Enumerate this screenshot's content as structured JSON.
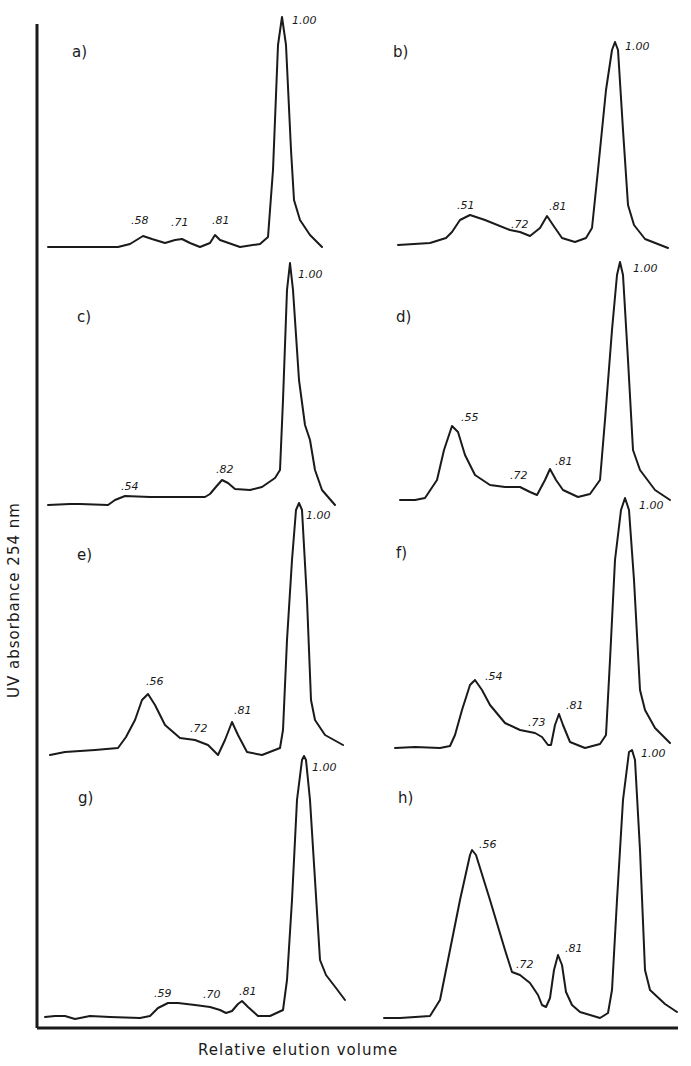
{
  "figure": {
    "ylabel": "UV absorbance   254 nm",
    "xlabel": "Relative elution volume",
    "colors": {
      "ink": "#1a1a1a",
      "background": "#ffffff"
    }
  },
  "chart_data": [
    {
      "type": "line",
      "panel": "a)",
      "xlabel": "Relative elution volume",
      "ylabel": "UV absorbance 254 nm",
      "peaks": [
        {
          "label": ".58",
          "relative_elution": 0.58,
          "relative_height": 0.1
        },
        {
          "label": ".71",
          "relative_elution": 0.71,
          "relative_height": 0.07
        },
        {
          "label": ".81",
          "relative_elution": 0.81,
          "relative_height": 0.09
        },
        {
          "label": "1.00",
          "relative_elution": 1.0,
          "relative_height": 1.0
        }
      ],
      "grid": false
    },
    {
      "type": "line",
      "panel": "b)",
      "xlabel": "Relative elution volume",
      "ylabel": "UV absorbance 254 nm",
      "peaks": [
        {
          "label": ".51",
          "relative_elution": 0.51,
          "relative_height": 0.15
        },
        {
          "label": ".72",
          "relative_elution": 0.72,
          "relative_height": 0.05
        },
        {
          "label": ".81",
          "relative_elution": 0.81,
          "relative_height": 0.14
        },
        {
          "label": "1.00",
          "relative_elution": 1.0,
          "relative_height": 1.0
        }
      ],
      "grid": false
    },
    {
      "type": "line",
      "panel": "c)",
      "xlabel": "Relative elution volume",
      "ylabel": "UV absorbance 254 nm",
      "peaks": [
        {
          "label": ".54",
          "relative_elution": 0.54,
          "relative_height": 0.04
        },
        {
          "label": ".82",
          "relative_elution": 0.82,
          "relative_height": 0.09
        },
        {
          "label": "1.00",
          "relative_elution": 1.0,
          "relative_height": 1.0
        }
      ],
      "grid": false
    },
    {
      "type": "line",
      "panel": "d)",
      "xlabel": "Relative elution volume",
      "ylabel": "UV absorbance 254 nm",
      "peaks": [
        {
          "label": ".55",
          "relative_elution": 0.55,
          "relative_height": 0.34
        },
        {
          "label": ".72",
          "relative_elution": 0.72,
          "relative_height": 0.05
        },
        {
          "label": ".81",
          "relative_elution": 0.81,
          "relative_height": 0.14
        },
        {
          "label": "1.00",
          "relative_elution": 1.0,
          "relative_height": 1.0
        }
      ],
      "grid": false
    },
    {
      "type": "line",
      "panel": "e)",
      "xlabel": "Relative elution volume",
      "ylabel": "UV absorbance 254 nm",
      "peaks": [
        {
          "label": ".56",
          "relative_elution": 0.56,
          "relative_height": 0.37
        },
        {
          "label": ".72",
          "relative_elution": 0.72,
          "relative_height": 0.1
        },
        {
          "label": ".81",
          "relative_elution": 0.81,
          "relative_height": 0.18
        },
        {
          "label": "1.00",
          "relative_elution": 1.0,
          "relative_height": 1.0
        }
      ],
      "grid": false
    },
    {
      "type": "line",
      "panel": "f)",
      "xlabel": "Relative elution volume",
      "ylabel": "UV absorbance 254 nm",
      "peaks": [
        {
          "label": ".54",
          "relative_elution": 0.54,
          "relative_height": 0.33
        },
        {
          "label": ".73",
          "relative_elution": 0.73,
          "relative_height": 0.06
        },
        {
          "label": ".81",
          "relative_elution": 0.81,
          "relative_height": 0.17
        },
        {
          "label": "1.00",
          "relative_elution": 1.0,
          "relative_height": 1.0
        }
      ],
      "grid": false
    },
    {
      "type": "line",
      "panel": "g)",
      "xlabel": "Relative elution volume",
      "ylabel": "UV absorbance 254 nm",
      "peaks": [
        {
          "label": ".59",
          "relative_elution": 0.59,
          "relative_height": 0.06
        },
        {
          "label": ".70",
          "relative_elution": 0.7,
          "relative_height": 0.04
        },
        {
          "label": ".81",
          "relative_elution": 0.81,
          "relative_height": 0.07
        },
        {
          "label": "1.00",
          "relative_elution": 1.0,
          "relative_height": 1.0
        }
      ],
      "grid": false
    },
    {
      "type": "line",
      "panel": "h)",
      "xlabel": "Relative elution volume",
      "ylabel": "UV absorbance 254 nm",
      "peaks": [
        {
          "label": ".56",
          "relative_elution": 0.56,
          "relative_height": 0.65
        },
        {
          "label": ".72",
          "relative_elution": 0.72,
          "relative_height": 0.17
        },
        {
          "label": ".81",
          "relative_elution": 0.81,
          "relative_height": 0.36
        },
        {
          "label": "1.00",
          "relative_elution": 1.0,
          "relative_height": 1.0
        }
      ],
      "grid": false
    }
  ],
  "panels": [
    {
      "id": "a",
      "title": "a)",
      "title_pos": [
        72,
        57
      ],
      "points": "48,247 70,247 118,247 130,244 143,236 152,239 165,243 175,240 182,239 190,243 200,247 210,243 215,235 220,240 240,247 260,244 268,237 273,170 278,45 282,17 286,45 291,150 294,200 300,220 310,235 322,247",
      "labels": [
        {
          "text": ".58",
          "x": 131,
          "y": 224
        },
        {
          "text": ".71",
          "x": 171,
          "y": 226
        },
        {
          "text": ".81",
          "x": 212,
          "y": 224
        },
        {
          "text": "1.00",
          "x": 292,
          "y": 24
        }
      ]
    },
    {
      "id": "b",
      "title": "b)",
      "title_pos": [
        393,
        57
      ],
      "points": "398,245 430,243 446,238 452,232 460,220 470,215 485,220 510,230 520,232 530,236 540,228 547,216 553,225 562,238 575,242 586,238 592,228 598,170 606,90 612,50 615,42 618,50 623,130 628,205 634,225 645,239 668,248",
      "labels": [
        {
          "text": ".51",
          "x": 457,
          "y": 209
        },
        {
          "text": ".72",
          "x": 511,
          "y": 228
        },
        {
          "text": ".81",
          "x": 549,
          "y": 210
        },
        {
          "text": "1.00",
          "x": 625,
          "y": 50
        }
      ]
    },
    {
      "id": "c",
      "title": "c)",
      "title_pos": [
        77,
        322
      ],
      "points": "48,505 70,504 80,504 108,505 115,500 125,496 150,497 180,497 205,497 210,494 215,488 222,480 228,483 235,489 250,490 262,487 275,478 280,470 283,400 287,290 290,263 293,290 299,380 305,425 310,440 315,470 322,490 335,505",
      "labels": [
        {
          "text": ".54",
          "x": 121,
          "y": 490
        },
        {
          "text": ".82",
          "x": 216,
          "y": 473
        },
        {
          "text": "1.00",
          "x": 298,
          "y": 278
        }
      ]
    },
    {
      "id": "d",
      "title": "d)",
      "title_pos": [
        396,
        322
      ],
      "points": "400,500 415,500 425,498 437,480 444,450 452,426 458,432 465,455 475,475 490,485 505,487 520,487 530,492 537,495 545,480 550,469 556,480 563,490 578,497 590,494 600,480 605,420 612,330 617,275 620,262 623,275 628,360 633,450 640,470 655,490 670,500",
      "labels": [
        {
          "text": ".55",
          "x": 461,
          "y": 421
        },
        {
          "text": ".72",
          "x": 510,
          "y": 479
        },
        {
          "text": ".81",
          "x": 555,
          "y": 465
        },
        {
          "text": "1.00",
          "x": 633,
          "y": 272
        }
      ]
    },
    {
      "id": "e",
      "title": "e)",
      "title_pos": [
        77,
        560
      ],
      "points": "50,755 65,752 95,750 118,748 126,737 135,720 142,700 148,694 155,705 165,725 180,738 195,740 208,745 218,755 225,740 232,722 238,735 247,752 262,755 280,748 283,730 287,640 292,560 296,510 299,503 302,510 307,600 311,700 315,720 325,735 343,745",
      "labels": [
        {
          "text": ".56",
          "x": 146,
          "y": 685
        },
        {
          "text": ".72",
          "x": 190,
          "y": 732
        },
        {
          "text": ".81",
          "x": 234,
          "y": 714
        },
        {
          "text": "1.00",
          "x": 306,
          "y": 519
        }
      ]
    },
    {
      "id": "f",
      "title": "f)",
      "title_pos": [
        396,
        558
      ],
      "points": "395,748 415,747 440,748 450,746 455,735 462,710 470,685 475,680 482,690 490,705 505,723 520,730 535,733 542,737 548,745 551,745 555,725 559,714 563,725 570,742 585,748 600,744 606,735 610,660 615,560 621,510 625,498 629,510 634,580 640,690 645,710 655,728 670,743",
      "labels": [
        {
          "text": ".54",
          "x": 485,
          "y": 680
        },
        {
          "text": ".73",
          "x": 528,
          "y": 726
        },
        {
          "text": ".81",
          "x": 566,
          "y": 709
        },
        {
          "text": "1.00",
          "x": 639,
          "y": 509
        }
      ]
    },
    {
      "id": "g",
      "title": "g)",
      "title_pos": [
        78,
        803
      ],
      "points": "45,1017 55,1016 65,1016 75,1019 90,1016 110,1017 140,1018 150,1016 158,1008 168,1003 178,1003 195,1005 210,1007 220,1010 226,1013 232,1011 238,1004 242,1001 248,1007 258,1016 270,1016 283,1010 287,980 292,900 297,800 302,760 304,756 306,760 310,800 315,880 320,960 326,975 336,988 345,1000",
      "labels": [
        {
          "text": ".59",
          "x": 154,
          "y": 997
        },
        {
          "text": ".70",
          "x": 203,
          "y": 998
        },
        {
          "text": ".81",
          "x": 239,
          "y": 995
        },
        {
          "text": "1.00",
          "x": 312,
          "y": 771
        }
      ]
    },
    {
      "id": "h",
      "title": "h)",
      "title_pos": [
        398,
        803
      ],
      "points": "384,1018 400,1018 430,1016 440,1000 450,950 460,900 470,855 472,850 476,855 490,900 505,950 512,972 520,975 530,983 538,995 542,1005 546,1007 550,998 554,970 558,955 562,965 566,992 572,1005 580,1012 600,1018 608,1013 612,990 617,900 623,800 629,752 632,750 635,760 640,850 645,970 650,990 665,1004 677,1012",
      "labels": [
        {
          "text": ".56",
          "x": 479,
          "y": 848
        },
        {
          "text": ".72",
          "x": 516,
          "y": 968
        },
        {
          "text": ".81",
          "x": 565,
          "y": 952
        },
        {
          "text": "1.00",
          "x": 641,
          "y": 757
        }
      ]
    }
  ]
}
